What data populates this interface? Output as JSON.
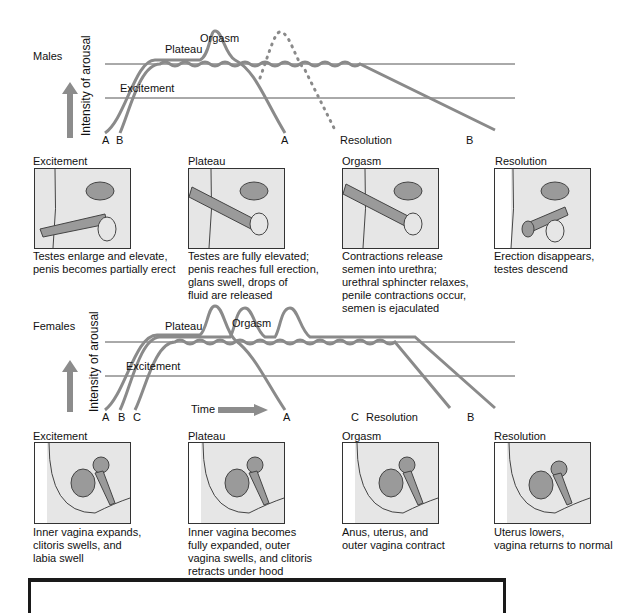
{
  "males": {
    "title": "Males",
    "yaxis_label": "Intensity of arousal",
    "phase_labels": {
      "excitement": "Excitement",
      "plateau": "Plateau",
      "orgasm": "Orgasm",
      "resolution": "Resolution"
    },
    "curve_labels": {
      "a_start": "A",
      "b_start": "B",
      "a_end": "A",
      "b_end": "B"
    },
    "panels": [
      {
        "title": "Excitement",
        "desc": "Testes enlarge and elevate,\npenis becomes partially erect"
      },
      {
        "title": "Plateau",
        "desc": "Testes are fully elevated;\npenis reaches full erection,\nglans swell, drops of\nfluid are released"
      },
      {
        "title": "Orgasm",
        "desc": "Contractions release\nsemen into urethra;\nurethral sphincter relaxes,\npenile contractions occur,\nsemen is ejaculated"
      },
      {
        "title": "Resolution",
        "desc": "Erection disappears,\ntestes descend"
      }
    ]
  },
  "females": {
    "title": "Females",
    "yaxis_label": "Intensity of arousal",
    "phase_labels": {
      "excitement": "Excitement",
      "plateau": "Plateau",
      "orgasm": "Orgasm",
      "resolution": "Resolution"
    },
    "time_label": "Time",
    "curve_labels": {
      "a_start": "A",
      "b_start": "B",
      "c_start": "C",
      "a_end": "A",
      "c_end": "C",
      "b_end": "B"
    },
    "panels": [
      {
        "title": "Excitement",
        "desc": "Inner vagina expands,\nclitoris swells, and\nlabia swell"
      },
      {
        "title": "Plateau",
        "desc": "Inner vagina becomes\nfully expanded, outer\nvagina swells, and clitoris\nretracts under hood"
      },
      {
        "title": "Orgasm",
        "desc": "Anus, uterus, and\nouter vagina contract"
      },
      {
        "title": "Resolution",
        "desc": "Uterus lowers,\nvagina returns to normal"
      }
    ]
  },
  "colors": {
    "curve": "#8a8a8a",
    "line": "#555555",
    "arrow": "#8c8c8c",
    "panel_bg": "#e6e6e6",
    "tissue": "#9a9a9a"
  }
}
